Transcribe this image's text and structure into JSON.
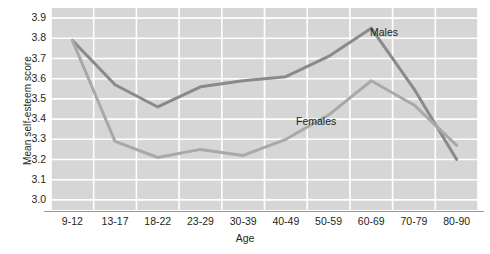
{
  "chart_data": {
    "type": "line",
    "title": "",
    "xlabel": "Age",
    "ylabel": "Mean self-esteem score",
    "categories": [
      "9-12",
      "13-17",
      "18-22",
      "23-29",
      "30-39",
      "40-49",
      "50-59",
      "60-69",
      "70-79",
      "80-90"
    ],
    "ylim": [
      2.95,
      3.95
    ],
    "yticks": [
      "3.0",
      "3.1",
      "3.2",
      "3.3",
      "3.4",
      "3.5",
      "3.6",
      "3.7",
      "3.8",
      "3.9"
    ],
    "ytick_values": [
      3.0,
      3.1,
      3.2,
      3.3,
      3.4,
      3.5,
      3.6,
      3.7,
      3.8,
      3.9
    ],
    "grid": true,
    "grid_color": "#ffffff",
    "plot_background": "#d6d6d6",
    "legend_position": "inline-annotations",
    "series": [
      {
        "name": "Males",
        "color": "#8a8a8a",
        "values": [
          3.79,
          3.57,
          3.46,
          3.56,
          3.59,
          3.61,
          3.71,
          3.85,
          3.55,
          3.2
        ]
      },
      {
        "name": "Females",
        "color": "#a9a9a9",
        "values": [
          3.79,
          3.29,
          3.21,
          3.25,
          3.22,
          3.3,
          3.42,
          3.59,
          3.47,
          3.27
        ]
      }
    ],
    "annotations": [
      {
        "text": "Males",
        "series": "Males"
      },
      {
        "text": "Females",
        "series": "Females"
      }
    ]
  }
}
